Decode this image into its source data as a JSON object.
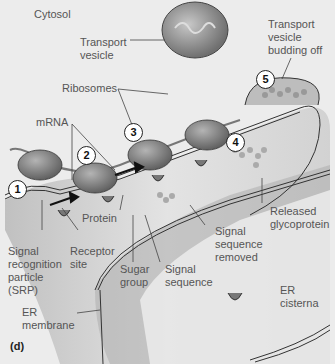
{
  "figure": {
    "panel_label": "(d)",
    "labels": {
      "cytosol": "Cytosol",
      "transport_vesicle": "Transport\nvesicle",
      "transport_vesicle_budding": "Transport\nvesicle\nbudding off",
      "ribosomes": "Ribosomes",
      "mrna": "mRNA",
      "protein": "Protein",
      "released_glycoprotein": "Released\nglycoprotein",
      "srp": "Signal\nrecognition\nparticle\n(SRP)",
      "receptor_site": "Receptor\nsite",
      "sugar_group": "Sugar\ngroup",
      "signal_sequence": "Signal\nsequence",
      "signal_sequence_removed": "Signal\nsequence\nremoved",
      "er_membrane": "ER\nmembrane",
      "er_cisterna": "ER\ncisterna"
    },
    "steps": [
      "1",
      "2",
      "3",
      "4",
      "5"
    ],
    "colors": {
      "background": "#ececec",
      "ribosome": "#8a8a8a",
      "er_lumen": "#b9b9b9",
      "membrane_edge": "#ffffff",
      "outline": "#333333",
      "vesicle": "#8f8f8f"
    }
  }
}
